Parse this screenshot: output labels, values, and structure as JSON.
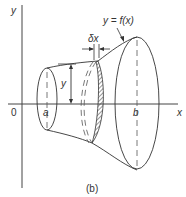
{
  "figure": {
    "caption": "(b)",
    "labels": {
      "y_axis": "y",
      "x_axis": "x",
      "origin": "0",
      "a": "a",
      "b": "b",
      "curve": "y = f(x)",
      "slice_width": "δx",
      "radius": "y"
    }
  }
}
